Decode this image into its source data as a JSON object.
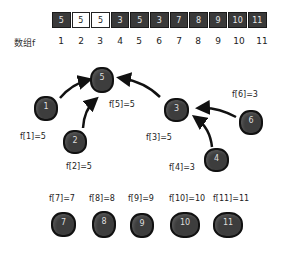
{
  "array": {
    "label": "数组f",
    "values": [
      "5",
      "5",
      "5",
      "3",
      "5",
      "3",
      "7",
      "8",
      "9",
      "10",
      "11"
    ],
    "indices": [
      "1",
      "2",
      "3",
      "4",
      "5",
      "6",
      "7",
      "8",
      "9",
      "10",
      "11"
    ],
    "highlighted_indices": [
      2,
      3
    ]
  },
  "tree": {
    "nodes": [
      {
        "id": "5",
        "label": "f[5]=5"
      },
      {
        "id": "1",
        "label": "f[1]=5"
      },
      {
        "id": "2",
        "label": "f[2]=5"
      },
      {
        "id": "3",
        "label": "f[3]=5"
      },
      {
        "id": "6",
        "label": "f[6]=3"
      },
      {
        "id": "4",
        "label": "f[4]=3"
      }
    ],
    "edges": [
      {
        "from": "1",
        "to": "5"
      },
      {
        "from": "2",
        "to": "5"
      },
      {
        "from": "3",
        "to": "5"
      },
      {
        "from": "6",
        "to": "3"
      },
      {
        "from": "4",
        "to": "3"
      }
    ]
  },
  "singletons": [
    {
      "id": "7",
      "label": "f[7]=7"
    },
    {
      "id": "8",
      "label": "f[8]=8"
    },
    {
      "id": "9",
      "label": "f[9]=9"
    },
    {
      "id": "10",
      "label": "f[10]=10"
    },
    {
      "id": "11",
      "label": "f[11]=11"
    }
  ],
  "colors": {
    "node_fill": "#3d3d3d",
    "node_border": "#111111",
    "cell_dark": "#3a3a3a",
    "cell_highlight": "#ffffff",
    "arrow": "#111111"
  }
}
